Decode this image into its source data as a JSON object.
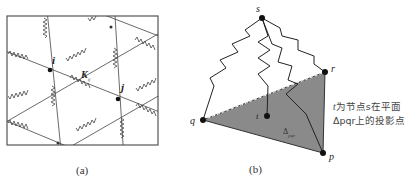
{
  "panel_a": {
    "caption": "(a)",
    "node_labels": {
      "i": "i",
      "j": "j",
      "k": "K"
    },
    "k_subscript": "ij"
  },
  "panel_b": {
    "caption": "(b)",
    "node_labels": {
      "s": "s",
      "r": "r",
      "q": "q",
      "p": "p",
      "t": "t"
    },
    "triangle_label": "Δ",
    "triangle_subscript": "pqr",
    "note_line1_var": "t",
    "note_line1_text": "为节点s在平面",
    "note_line2_text": "Δpqr上的投影点",
    "fill_color": "#8a8a8a"
  }
}
